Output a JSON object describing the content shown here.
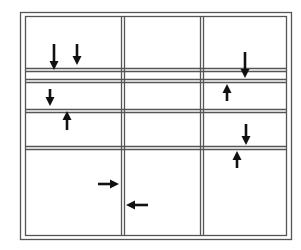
{
  "diagram": {
    "line_color": "#555555",
    "arrow_color": "#111111",
    "frame": {
      "outer": {
        "x1": 20,
        "y1": 12,
        "x2": 291,
        "y2": 239
      },
      "inner": {
        "x1": 25,
        "y1": 16,
        "x2": 286,
        "y2": 235
      }
    },
    "vertical_dividers": [
      {
        "name": "divider-left",
        "x": [
          121,
          124
        ]
      },
      {
        "name": "divider-right",
        "x": [
          200,
          203
        ]
      }
    ],
    "horizontal_dividers": [
      {
        "name": "divider-row-1",
        "y": [
          68,
          71
        ]
      },
      {
        "name": "divider-row-2",
        "y": [
          79,
          82
        ]
      },
      {
        "name": "divider-row-3",
        "y": [
          109,
          112
        ]
      },
      {
        "name": "divider-row-4",
        "y": [
          146,
          149
        ]
      }
    ],
    "arrows": [
      {
        "name": "arrow-down-1",
        "direction": "down",
        "x": 54,
        "y1": 44,
        "y2": 70
      },
      {
        "name": "arrow-down-2",
        "direction": "down",
        "x": 77,
        "y1": 44,
        "y2": 65
      },
      {
        "name": "arrow-down-3",
        "direction": "down",
        "x": 50,
        "y1": 89,
        "y2": 106
      },
      {
        "name": "arrow-up-1",
        "direction": "up",
        "x": 67,
        "y1": 111,
        "y2": 130
      },
      {
        "name": "arrow-down-4",
        "direction": "down",
        "x": 245,
        "y1": 52,
        "y2": 78
      },
      {
        "name": "arrow-up-2",
        "direction": "up",
        "x": 227,
        "y1": 84,
        "y2": 101
      },
      {
        "name": "arrow-down-5",
        "direction": "down",
        "x": 246,
        "y1": 124,
        "y2": 145
      },
      {
        "name": "arrow-up-3",
        "direction": "up",
        "x": 237,
        "y1": 151,
        "y2": 168
      },
      {
        "name": "arrow-right-1",
        "direction": "right",
        "y": 184,
        "x1": 98,
        "x2": 119
      },
      {
        "name": "arrow-left-1",
        "direction": "left",
        "y": 205,
        "x1": 126,
        "x2": 148
      }
    ]
  }
}
